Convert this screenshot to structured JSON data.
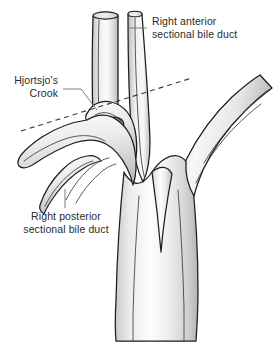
{
  "figure": {
    "kind": "anatomical-illustration",
    "background_color": "#ffffff",
    "outline_color": "#1c1c1c",
    "fill_light": "#fdfdfd",
    "fill_mid": "#e2e2e2",
    "fill_shadow": "#b9b9b9",
    "text_color": "#2b2b2b",
    "leader_color": "#6e6e6e",
    "dash_color": "#3a3a3a"
  },
  "labels": {
    "anterior": {
      "line1": "Right anterior",
      "line2": "sectional bile duct",
      "align": "start"
    },
    "crook": {
      "line1": "Hjortsjo's",
      "line2": "Crook",
      "align": "end"
    },
    "posterior": {
      "line1": "Right posterior",
      "line2": "sectional bile duct",
      "align": "middle"
    }
  },
  "structures": {
    "anterior_duct": "right anterior sectional bile duct",
    "posterior_duct": "right posterior sectional bile duct",
    "crook": "Hjortsjo's Crook",
    "right_branch": "right lateral duct branch",
    "main_trunk": "common hepatic duct trunk"
  }
}
